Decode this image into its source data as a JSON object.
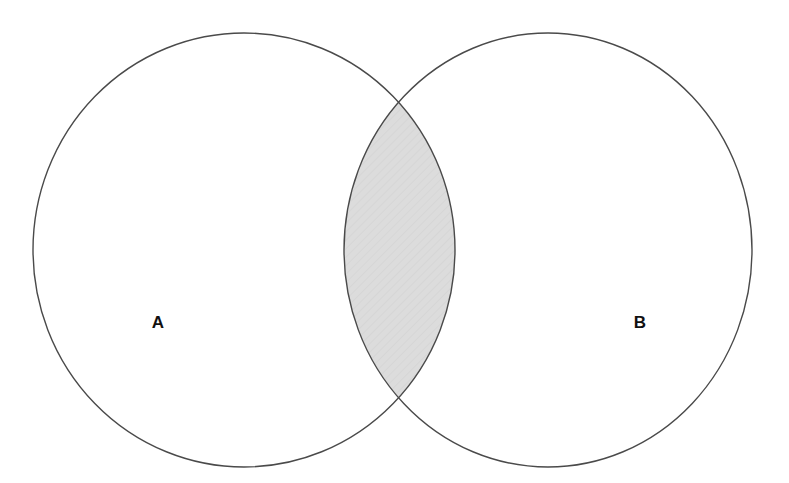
{
  "diagram": {
    "type": "venn",
    "background_color": "#ffffff",
    "stroke_color": "#4a4a4a",
    "stroke_width": 1.4,
    "label_color": "#111111",
    "shaded_region": "intersection",
    "shade_color": "#dcdcdc",
    "sets": [
      {
        "id": "A",
        "label": "A",
        "label_x": 158,
        "label_y": 324,
        "center_x": 244,
        "center_y": 250,
        "radius_x": 211,
        "radius_y": 217,
        "fill": "none"
      },
      {
        "id": "B",
        "label": "B",
        "label_x": 640,
        "label_y": 324,
        "center_x": 548,
        "center_y": 250,
        "radius_x": 204,
        "radius_y": 217,
        "fill": "none"
      }
    ],
    "intersection": {
      "label": "",
      "fill": "#dcdcdc",
      "top_point_x": 401,
      "top_point_y": 108,
      "bottom_point_x": 401,
      "bottom_point_y": 392
    }
  },
  "chart_data": {
    "type": "diagram",
    "categories": [
      "A",
      "B",
      "A ∩ B"
    ],
    "shaded": [
      "A ∩ B"
    ],
    "unshaded": [
      "A only",
      "B only"
    ],
    "legend": [],
    "annotations": [
      "A",
      "B"
    ]
  }
}
